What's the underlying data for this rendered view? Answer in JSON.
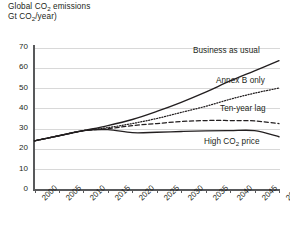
{
  "chart_data": {
    "type": "line",
    "title": "Global CO2 emissions",
    "title_line1_pre": "Global CO",
    "title_line1_sub": "2",
    "title_line1_post": " emissions",
    "title_line2_pre": "Gt CO",
    "title_line2_sub": "2",
    "title_line2_post": "/year)",
    "xlabel": "",
    "ylabel": "",
    "xlim": [
      2000,
      2050
    ],
    "ylim": [
      0,
      70
    ],
    "grid": true,
    "legend_position": "inline-right",
    "x": [
      2000,
      2005,
      2010,
      2015,
      2020,
      2025,
      2030,
      2035,
      2040,
      2045,
      2050
    ],
    "xtick_labels": [
      "2000",
      "2005",
      "2010",
      "2015",
      "2020",
      "2025",
      "2030",
      "2035",
      "2040",
      "2045",
      "2050"
    ],
    "ytick_labels": [
      "0",
      "10",
      "20",
      "30",
      "40",
      "50",
      "60",
      "70"
    ],
    "ytick_values": [
      0,
      10,
      20,
      30,
      40,
      50,
      60,
      70
    ],
    "series": [
      {
        "name": "Business as usual",
        "label": "Business as usual",
        "style": "solid",
        "color": "#231f20",
        "values": [
          24.0,
          26.5,
          29.0,
          31.5,
          34.5,
          38.5,
          43.0,
          48.0,
          53.5,
          58.5,
          63.5
        ]
      },
      {
        "name": "Annex B only",
        "label": "Annex B only",
        "style": "dotted",
        "color": "#231f20",
        "values": [
          24.0,
          26.5,
          29.0,
          30.5,
          32.5,
          35.0,
          38.0,
          41.0,
          44.5,
          47.5,
          50.0
        ]
      },
      {
        "name": "Ten-year lag",
        "label": "Ten-year lag",
        "style": "dashed",
        "color": "#231f20",
        "values": [
          24.0,
          26.5,
          29.0,
          30.0,
          31.5,
          32.5,
          33.5,
          34.0,
          34.0,
          33.8,
          32.5
        ]
      },
      {
        "name": "High CO2 price",
        "label_pre": "High CO",
        "label_sub": "2",
        "label_post": " price",
        "style": "solid",
        "color": "#231f20",
        "values": [
          24.0,
          26.5,
          29.0,
          29.5,
          28.0,
          28.2,
          28.6,
          28.9,
          29.0,
          29.0,
          26.0
        ]
      }
    ]
  }
}
